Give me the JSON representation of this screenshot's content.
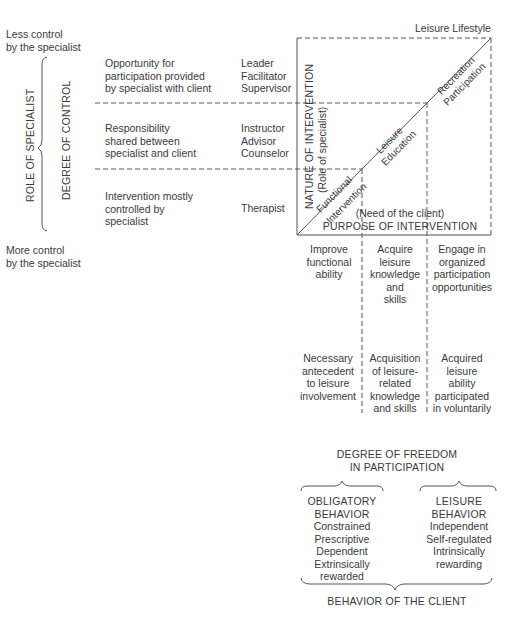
{
  "left_axis": {
    "top_label": [
      "Less control",
      "by the specialist"
    ],
    "bottom_label": [
      "More control",
      "by the specialist"
    ],
    "outer_label": "ROLE OF SPECIALIST",
    "inner_label": "DEGREE OF CONTROL"
  },
  "rows": [
    {
      "description": [
        "Opportunity for",
        "participation provided",
        "by specialist with client"
      ],
      "roles": [
        "Leader",
        "Facilitator",
        "Supervisor"
      ]
    },
    {
      "description": [
        "Responsibility",
        "shared between",
        "specialist and client"
      ],
      "roles": [
        "Instructor",
        "Advisor",
        "Counselor"
      ]
    },
    {
      "description": [
        "Intervention mostly",
        "controlled by",
        "specialist"
      ],
      "roles": [
        "Therapist"
      ]
    }
  ],
  "box": {
    "corner_label": "Leisure Lifestyle",
    "vertical_axis": [
      "NATURE OF INTERVENTION",
      "(Role of specialist)"
    ],
    "horizontal_axis": [
      "(Need of the client)",
      "PURPOSE OF INTERVENTION"
    ],
    "diagonal_segments": [
      {
        "top": "Functional",
        "bottom": "Intervention"
      },
      {
        "top": "Leisure",
        "bottom": "Education"
      },
      {
        "top": "Recreation",
        "bottom": "Participation"
      }
    ]
  },
  "columns": [
    {
      "purpose": [
        "Improve",
        "functional",
        "ability"
      ],
      "outcome": [
        "Necessary",
        "antecedent",
        "to leisure",
        "involvement"
      ]
    },
    {
      "purpose": [
        "Acquire",
        "leisure",
        "knowledge",
        "and",
        "skills"
      ],
      "outcome": [
        "Acquisition",
        "of leisure-",
        "related",
        "knowledge",
        "and skills"
      ]
    },
    {
      "purpose": [
        "Engage in",
        "organized",
        "participation",
        "opportunities"
      ],
      "outcome": [
        "Acquired",
        "leisure",
        "ability",
        "participated",
        "in voluntarily"
      ]
    }
  ],
  "freedom": {
    "title": [
      "DEGREE OF FREEDOM",
      "IN PARTICIPATION"
    ],
    "obligatory": [
      "OBLIGATORY",
      "BEHAVIOR",
      "Constrained",
      "Prescriptive",
      "Dependent",
      "Extrinsically",
      "rewarded"
    ],
    "leisure": [
      "LEISURE",
      "BEHAVIOR",
      "Independent",
      "Self-regulated",
      "Intrinsically",
      "rewarding"
    ],
    "bottom_label": "BEHAVIOR OF THE CLIENT"
  },
  "colors": {
    "text": "#3a3a3a",
    "line": "#555555"
  }
}
